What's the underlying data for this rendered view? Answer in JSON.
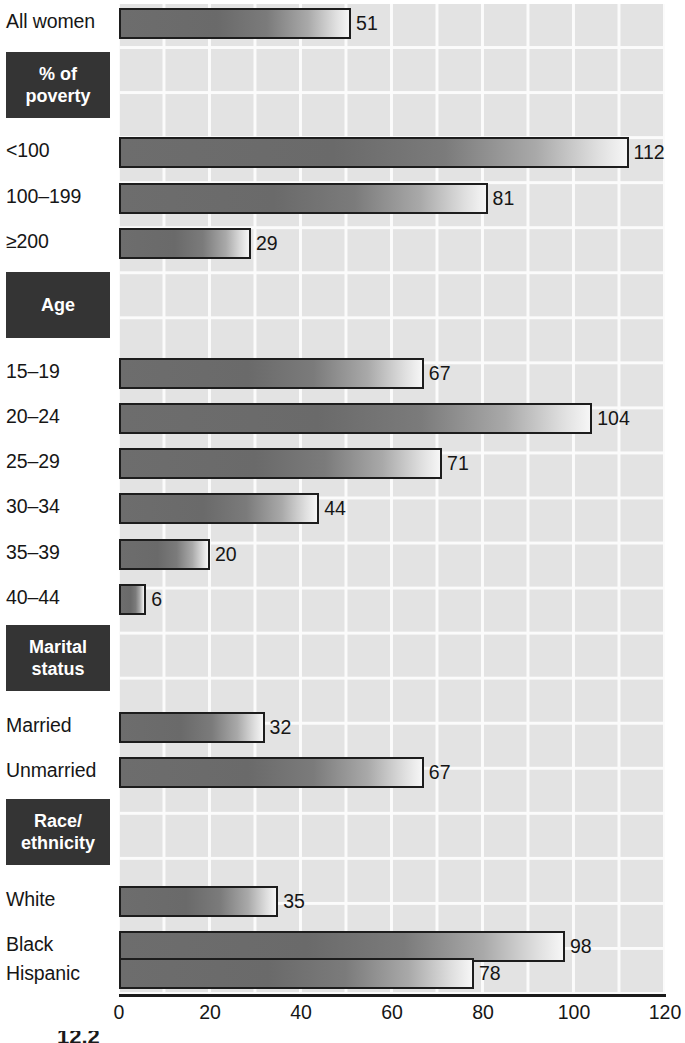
{
  "chart_data": {
    "type": "bar",
    "orientation": "horizontal",
    "title": "",
    "xlabel": "",
    "ylabel": "",
    "xlim": [
      0,
      120
    ],
    "xticks": [
      0,
      20,
      40,
      60,
      80,
      100,
      120
    ],
    "grid": true,
    "legend": null,
    "grid_step": 10,
    "categories": [
      "All women",
      "<100",
      "100–199",
      "≥200",
      "15–19",
      "20–24",
      "25–29",
      "30–34",
      "35–39",
      "40–44",
      "Married",
      "Unmarried",
      "White",
      "Black",
      "Hispanic"
    ],
    "values": [
      51,
      112,
      81,
      29,
      67,
      104,
      71,
      44,
      20,
      6,
      32,
      67,
      35,
      98,
      78
    ],
    "section_headings": [
      "% of poverty",
      "Age",
      "Marital status",
      "Race/ethnicity"
    ],
    "groups": [
      {
        "heading": null,
        "rows": [
          {
            "label": "All women",
            "value": 51
          }
        ]
      },
      {
        "heading": "% of poverty",
        "rows": [
          {
            "label": "<100",
            "value": 112
          },
          {
            "label": "100–199",
            "value": 81
          },
          {
            "label": "≥200",
            "value": 29
          }
        ]
      },
      {
        "heading": "Age",
        "rows": [
          {
            "label": "15–19",
            "value": 67
          },
          {
            "label": "20–24",
            "value": 104
          },
          {
            "label": "25–29",
            "value": 71
          },
          {
            "label": "30–34",
            "value": 44
          },
          {
            "label": "35–39",
            "value": 20
          },
          {
            "label": "40–44",
            "value": 6
          }
        ]
      },
      {
        "heading": "Marital status",
        "rows": [
          {
            "label": "Married",
            "value": 32
          },
          {
            "label": "Unmarried",
            "value": 67
          }
        ]
      },
      {
        "heading": "Race/ethnicity",
        "rows": [
          {
            "label": "White",
            "value": 35
          },
          {
            "label": "Black",
            "value": 98
          },
          {
            "label": "Hispanic",
            "value": 78
          }
        ]
      }
    ]
  },
  "rows": [
    {
      "label": "All women",
      "value": "51",
      "num": 51,
      "top": 8,
      "label_top": 10
    },
    {
      "label": "<100",
      "value": "112",
      "num": 112,
      "top": 137,
      "label_top": 139
    },
    {
      "label": "100–199",
      "value": "81",
      "num": 81,
      "top": 183,
      "label_top": 185
    },
    {
      "label": "≥200",
      "value": "29",
      "num": 29,
      "top": 228,
      "label_top": 230
    },
    {
      "label": "15–19",
      "value": "67",
      "num": 67,
      "top": 358,
      "label_top": 360
    },
    {
      "label": "20–24",
      "value": "104",
      "num": 104,
      "top": 403,
      "label_top": 405
    },
    {
      "label": "25–29",
      "value": "71",
      "num": 71,
      "top": 448,
      "label_top": 450
    },
    {
      "label": "30–34",
      "value": "44",
      "num": 44,
      "top": 493,
      "label_top": 495
    },
    {
      "label": "35–39",
      "value": "20",
      "num": 20,
      "top": 539,
      "label_top": 541
    },
    {
      "label": "40–44",
      "value": "6",
      "num": 6,
      "top": 584,
      "label_top": 586
    },
    {
      "label": "Married",
      "value": "32",
      "num": 32,
      "top": 712,
      "label_top": 714
    },
    {
      "label": "Unmarried",
      "value": "67",
      "num": 67,
      "top": 757,
      "label_top": 759
    },
    {
      "label": "White",
      "value": "35",
      "num": 35,
      "top": 886,
      "label_top": 888
    },
    {
      "label": "Black",
      "value": "98",
      "num": 98,
      "top": 931,
      "label_top": 933
    },
    {
      "label": "Hispanic",
      "value": "78",
      "num": 78,
      "top": 958,
      "label_top": 962
    }
  ],
  "sections": [
    {
      "line1": "% of",
      "line2": "poverty",
      "top": 52,
      "height": 66
    },
    {
      "line1": "Age",
      "line2": "",
      "top": 272,
      "height": 66
    },
    {
      "line1": "Marital",
      "line2": "status",
      "top": 625,
      "height": 66
    },
    {
      "line1": "Race/",
      "line2": "ethnicity",
      "top": 799,
      "height": 66
    }
  ],
  "axis": {
    "ticks": [
      {
        "label": "0",
        "left": 99
      },
      {
        "label": "20",
        "left": 190
      },
      {
        "label": "40",
        "left": 281
      },
      {
        "label": "60",
        "left": 372
      },
      {
        "label": "80",
        "left": 463
      },
      {
        "label": "100",
        "left": 554
      },
      {
        "label": "120",
        "left": 645
      }
    ]
  },
  "caption_sliver": "12.2",
  "colors": {
    "plot_background": "#e3e3e3",
    "gridline": "#fbfbfb",
    "bar_dark": "#6a6a6a",
    "bar_light": "#f6f6f6",
    "bar_border": "#1d1d1d",
    "section_box": "#343434",
    "section_text": "#ffffff",
    "text": "#161616",
    "axis": "#1b1b1b",
    "page_background": "#ffffff"
  }
}
